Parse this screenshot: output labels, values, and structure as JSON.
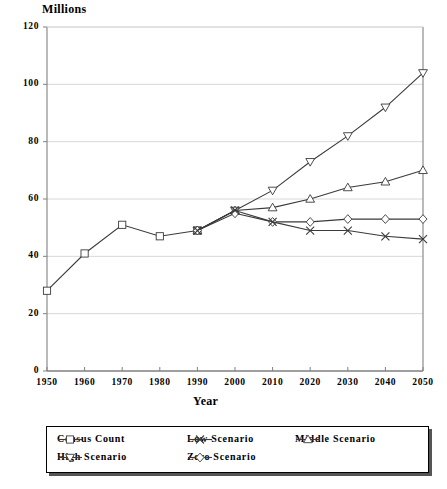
{
  "chart_data": {
    "type": "line",
    "title": "",
    "ylabel": "Millions",
    "xlabel": "Year",
    "categories": [
      "1950",
      "1960",
      "1970",
      "1980",
      "1990",
      "2000",
      "2010",
      "2020",
      "2030",
      "2040",
      "2050"
    ],
    "x": [
      1950,
      1960,
      1970,
      1980,
      1990,
      2000,
      2010,
      2020,
      2030,
      2040,
      2050
    ],
    "ylim": [
      0,
      120
    ],
    "xlim": [
      1950,
      2050
    ],
    "y_ticks": [
      "0",
      "20",
      "40",
      "60",
      "80",
      "100",
      "120"
    ],
    "y_tick_values": [
      0,
      20,
      40,
      60,
      80,
      100,
      120
    ],
    "grid": true,
    "legend_position": "below",
    "series": [
      {
        "name": "Census Count",
        "marker": "square",
        "values": [
          28,
          41,
          51,
          47,
          49,
          null,
          null,
          null,
          null,
          null,
          null
        ]
      },
      {
        "name": "High Scenario",
        "marker": "triangle-down",
        "values": [
          null,
          null,
          null,
          null,
          49,
          56,
          63,
          73,
          82,
          92,
          104
        ]
      },
      {
        "name": "Middle Scenario",
        "marker": "triangle-up",
        "values": [
          null,
          null,
          null,
          null,
          49,
          56,
          57,
          60,
          64,
          66,
          70
        ]
      },
      {
        "name": "Zero Scenario",
        "marker": "diamond",
        "values": [
          null,
          null,
          null,
          null,
          49,
          55,
          52,
          52,
          53,
          53,
          53
        ]
      },
      {
        "name": "Low Scenario",
        "marker": "cross",
        "values": [
          null,
          null,
          null,
          null,
          49,
          56,
          52,
          49,
          49,
          47,
          46
        ]
      }
    ]
  },
  "axes": {
    "y_title": "Millions",
    "x_title": "Year"
  },
  "legend": {
    "entries": [
      {
        "label": "Census Count",
        "marker": "square-marker-icon"
      },
      {
        "label": "Low Scenario",
        "marker": "cross-marker-icon"
      },
      {
        "label": "Middle Scenario",
        "marker": "triangle-up-marker-icon"
      },
      {
        "label": "High Scenario",
        "marker": "triangle-down-marker-icon"
      },
      {
        "label": "Zero Scenario",
        "marker": "diamond-marker-icon"
      }
    ]
  },
  "colors": {
    "line": "#3a3a3a",
    "grid": "#d8d8d8",
    "axis": "#808080",
    "text": "#000000"
  }
}
